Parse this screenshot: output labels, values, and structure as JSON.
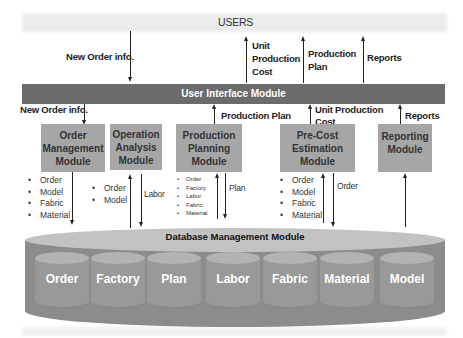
{
  "diagram": {
    "users_label": "USERS",
    "top_flows": [
      {
        "label": "New Order info.",
        "direction": "down"
      },
      {
        "label_lines": [
          "Unit",
          "Production",
          "Cost"
        ],
        "direction": "up"
      },
      {
        "label_lines": [
          "Production",
          "Plan"
        ],
        "direction": "up"
      },
      {
        "label": "Reports",
        "direction": "up"
      }
    ],
    "ui_module": "User Interface Module",
    "mid_flows": {
      "new_order": "New Order info.",
      "production_plan": "Production Plan",
      "unit_production_cost_lines": [
        "Unit Production",
        "Cost"
      ],
      "reports": "Reports"
    },
    "modules": [
      {
        "id": "order-management",
        "lines": [
          "Order",
          "Management",
          "Module"
        ],
        "items": [
          "Order",
          "Model",
          "Fabric",
          "Material"
        ]
      },
      {
        "id": "operation-analysis",
        "lines": [
          "Operation",
          "Analysis",
          "Module"
        ],
        "items": [
          "Order",
          "Model"
        ],
        "flow_label": "Labor"
      },
      {
        "id": "production-planning",
        "lines": [
          "Production",
          "Planning",
          "Module"
        ],
        "items": [
          "Order",
          "Factory",
          "Labor",
          "Fabric",
          "Material"
        ],
        "flow_label": "Plan"
      },
      {
        "id": "pre-cost-estimation",
        "lines": [
          "Pre-Cost",
          "Estimation",
          "Module"
        ],
        "items": [
          "Order",
          "Model",
          "Fabric",
          "Material"
        ],
        "flow_label": "Order"
      },
      {
        "id": "reporting",
        "lines": [
          "Reporting",
          "Module"
        ]
      }
    ],
    "database": {
      "title": "Database Management Module",
      "tables": [
        "Order",
        "Factory",
        "Plan",
        "Labor",
        "Fabric",
        "Material",
        "Model"
      ]
    },
    "colors": {
      "ui_bar": "#6b6b6b",
      "module_box": "#a6a6a6",
      "db_body": "#8c8c8c",
      "db_top": "#c2c2c2",
      "table_cylinder": "#999999"
    }
  }
}
